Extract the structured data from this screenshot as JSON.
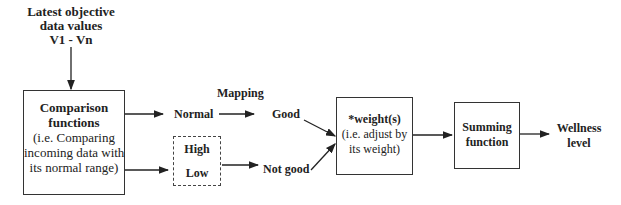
{
  "input": {
    "lines": [
      "Latest objective",
      "data values",
      "V1 - Vn"
    ]
  },
  "comparison": {
    "title_lines": [
      "Comparison",
      "functions"
    ],
    "desc_lines": [
      "(i.e. Comparing",
      "incoming data with",
      "its normal range)"
    ]
  },
  "mapping_label": "Mapping",
  "normal_label": "Normal",
  "abnormal": {
    "high": "High",
    "low": "Low"
  },
  "good_label": "Good",
  "not_good_label": "Not good",
  "weight": {
    "title": "*weight(s)",
    "desc_lines": [
      "(i.e. adjust by",
      "its weight)"
    ]
  },
  "summing": {
    "title_lines": [
      "Summing",
      "function"
    ]
  },
  "output": {
    "lines": [
      "Wellness",
      "level"
    ]
  }
}
